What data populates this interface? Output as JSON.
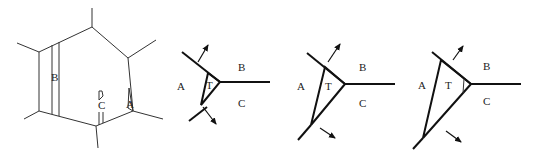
{
  "figures": [
    {
      "id": "hexagon",
      "labels": {
        "B": "B",
        "C": "C",
        "A": "A"
      }
    },
    {
      "id": "stage-1",
      "labels": {
        "A": "A",
        "T": "T",
        "B": "B",
        "C": "C"
      }
    },
    {
      "id": "stage-2",
      "labels": {
        "A": "A",
        "T": "T",
        "B": "B",
        "C": "C"
      }
    },
    {
      "id": "stage-3",
      "labels": {
        "A": "A",
        "T": "T",
        "B": "B",
        "C": "C"
      }
    }
  ],
  "colors": {
    "line": "#111111",
    "background": "#ffffff"
  }
}
